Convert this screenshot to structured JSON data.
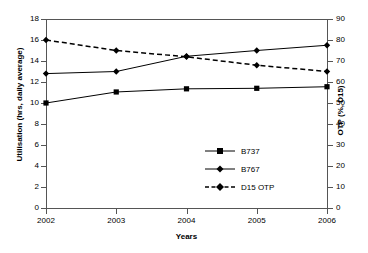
{
  "chart_data": {
    "type": "line",
    "title": "",
    "xlabel": "Years",
    "ylabel": "Utilisation (hrs, daily average)",
    "y2label": "OTP (%, D15)",
    "categories": [
      "2002",
      "2003",
      "2004",
      "2005",
      "2006"
    ],
    "x": [
      2002,
      2003,
      2004,
      2005,
      2006
    ],
    "ylim": [
      0,
      18
    ],
    "yticks": [
      0,
      2,
      4,
      6,
      8,
      10,
      12,
      14,
      16,
      18
    ],
    "y2lim": [
      0,
      90
    ],
    "y2ticks": [
      0,
      10,
      20,
      30,
      40,
      50,
      60,
      70,
      80,
      90
    ],
    "grid": false,
    "legend_position": "inside-center-right",
    "series": [
      {
        "name": "B737",
        "axis": "left",
        "marker": "square",
        "linestyle": "solid",
        "color": "#000000",
        "values": [
          10.0,
          11.05,
          11.35,
          11.4,
          11.55
        ]
      },
      {
        "name": "B767",
        "axis": "left",
        "marker": "diamond",
        "linestyle": "solid",
        "color": "#000000",
        "values": [
          12.8,
          13.0,
          14.45,
          15.0,
          15.5
        ]
      },
      {
        "name": "D15 OTP",
        "axis": "right",
        "marker": "diamond",
        "linestyle": "dashed",
        "color": "#000000",
        "values": [
          80,
          75,
          72,
          68,
          65
        ],
        "values_left_scale": [
          16.0,
          15.0,
          14.4,
          13.6,
          13.0
        ]
      }
    ]
  },
  "axes": {
    "left": {
      "title": "Utilisation (hrs, daily average)",
      "ticks": [
        "0",
        "2",
        "4",
        "6",
        "8",
        "10",
        "12",
        "14",
        "16",
        "18"
      ]
    },
    "right": {
      "title": "OTP (%, D15)",
      "ticks": [
        "0",
        "10",
        "20",
        "30",
        "40",
        "50",
        "60",
        "70",
        "80",
        "90"
      ]
    },
    "bottom": {
      "title": "Years",
      "ticks": [
        "2002",
        "2003",
        "2004",
        "2005",
        "2006"
      ]
    }
  },
  "legend": {
    "items": [
      {
        "label": "B737"
      },
      {
        "label": "B767"
      },
      {
        "label": "D15 OTP"
      }
    ]
  },
  "colors": {
    "line": "#000000",
    "axis": "#555555",
    "background": "#ffffff"
  }
}
